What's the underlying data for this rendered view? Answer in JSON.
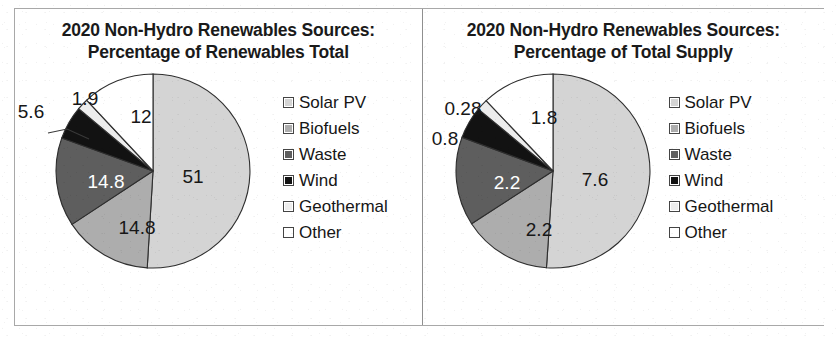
{
  "colors": {
    "solar_pv": "#d4d4d4",
    "biofuels": "#adadad",
    "waste": "#5e5e5e",
    "wind": "#121212",
    "geothermal": "#ededed",
    "other": "#ffffff",
    "slice_outline": "#2e2e2e",
    "panel_border": "#a8a8a8",
    "text": "#1a1a1a"
  },
  "legend_labels": [
    "Solar PV",
    "Biofuels",
    "Waste",
    "Wind",
    "Geothermal",
    "Other"
  ],
  "charts": [
    {
      "title_line1": "2020 Non-Hydro Renewables Sources:",
      "title_line2": "Percentage of Renewables Total",
      "labels": {
        "solar_pv": "51",
        "biofuels": "14.8",
        "waste": "14.8",
        "wind": "5.6",
        "geothermal": "1.9",
        "other": "12"
      }
    },
    {
      "title_line1": "2020 Non-Hydro Renewables Sources:",
      "title_line2": "Percentage of Total Supply",
      "labels": {
        "solar_pv": "7.6",
        "biofuels": "2.2",
        "waste": "2.2",
        "wind": "0.8",
        "geothermal": "0.28",
        "other": "1.8"
      }
    }
  ],
  "chart_data": [
    {
      "type": "pie",
      "title": "2020 Non-Hydro Renewables Sources: Percentage of Renewables Total",
      "xlabel": "",
      "ylabel": "",
      "legend_position": "right",
      "grid": false,
      "categories": [
        "Solar PV",
        "Biofuels",
        "Waste",
        "Wind",
        "Geothermal",
        "Other"
      ],
      "values": [
        51,
        14.8,
        14.8,
        5.6,
        1.9,
        12
      ],
      "data_labels": [
        "51",
        "14.8",
        "14.8",
        "5.6",
        "1.9",
        "12"
      ],
      "units": "percent of renewables total",
      "start_angle_deg": 0,
      "direction": "clockwise",
      "annotations": [
        "5.6 label placed outside with leader line to Wind slice",
        "1.9 label placed outside above Geothermal sliver"
      ]
    },
    {
      "type": "pie",
      "title": "2020 Non-Hydro Renewables Sources: Percentage of Total Supply",
      "xlabel": "",
      "ylabel": "",
      "legend_position": "right",
      "grid": false,
      "categories": [
        "Solar PV",
        "Biofuels",
        "Waste",
        "Wind",
        "Geothermal",
        "Other"
      ],
      "values": [
        7.6,
        2.2,
        2.2,
        0.8,
        0.28,
        1.8
      ],
      "data_labels": [
        "7.6",
        "2.2",
        "2.2",
        "0.8",
        "0.28",
        "1.8"
      ],
      "units": "percent of total supply",
      "start_angle_deg": 0,
      "direction": "clockwise",
      "annotations": [
        "0.8 label placed outside left of Wind slice",
        "0.28 label placed outside left of Geothermal sliver"
      ]
    }
  ]
}
